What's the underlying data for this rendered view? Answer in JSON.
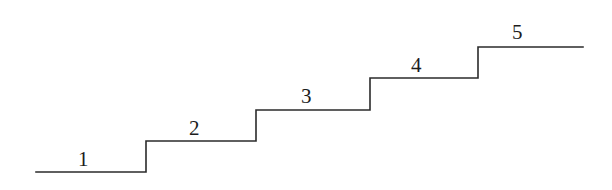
{
  "figure": {
    "name": "staircase-diagram",
    "background_color": "#ffffff",
    "line_color": "#2b2b2b",
    "label_color": "#1c1c1c",
    "line_width": 1.6,
    "width": 612,
    "height": 190
  },
  "steps": [
    {
      "number": "1",
      "label_x": 78,
      "label_y": 149,
      "tread_start_x": 36,
      "tread_end_x": 146,
      "tread_y": 172
    },
    {
      "number": "2",
      "label_x": 189,
      "label_y": 118,
      "tread_start_x": 146,
      "tread_end_x": 256,
      "tread_y": 141
    },
    {
      "number": "3",
      "label_x": 301,
      "label_y": 86,
      "tread_start_x": 256,
      "tread_end_x": 370,
      "tread_y": 110
    },
    {
      "number": "4",
      "label_x": 411,
      "label_y": 55,
      "tread_start_x": 370,
      "tread_end_x": 478,
      "tread_y": 78
    },
    {
      "number": "5",
      "label_x": 512,
      "label_y": 22,
      "tread_start_x": 478,
      "tread_end_x": 583,
      "tread_y": 47
    }
  ],
  "path": {
    "points_description": "M 36 172 H 146 V 141 H 256 V 110 H 370 V 78 H 478 V 47 H 583",
    "d": "M 36 172 L 146 172 L 146 141 L 256 141 L 256 110 L 370 110 L 370 78 L 478 78 L 478 47 L 583 47"
  },
  "chart_data": {
    "type": "line",
    "xlabel": "",
    "ylabel": "",
    "categories": [
      "1",
      "2",
      "3",
      "4",
      "5"
    ],
    "values": [
      1,
      2,
      3,
      4,
      5
    ],
    "annotations": [
      "1",
      "2",
      "3",
      "4",
      "5"
    ],
    "grid": false,
    "legend": "none",
    "xlim": [
      36,
      583
    ],
    "ylim": [
      47,
      172
    ],
    "series": [
      {
        "name": "staircase-outline",
        "points": [
          [
            36,
            172
          ],
          [
            146,
            172
          ],
          [
            146,
            141
          ],
          [
            256,
            141
          ],
          [
            256,
            110
          ],
          [
            370,
            110
          ],
          [
            370,
            78
          ],
          [
            478,
            78
          ],
          [
            478,
            47
          ],
          [
            583,
            47
          ]
        ]
      }
    ]
  }
}
